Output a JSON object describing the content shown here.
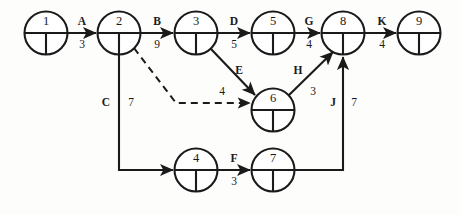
{
  "diagram": {
    "type": "activity-on-arrow-network",
    "title": "",
    "nodes": [
      {
        "id": "1",
        "label": "1",
        "cx": 46,
        "cy": 33
      },
      {
        "id": "2",
        "label": "2",
        "cx": 119,
        "cy": 33
      },
      {
        "id": "3",
        "label": "3",
        "cx": 196,
        "cy": 33
      },
      {
        "id": "5",
        "label": "5",
        "cx": 273,
        "cy": 33
      },
      {
        "id": "8",
        "label": "8",
        "cx": 343,
        "cy": 33
      },
      {
        "id": "9",
        "label": "9",
        "cx": 419,
        "cy": 33
      },
      {
        "id": "6",
        "label": "6",
        "cx": 273,
        "cy": 110
      },
      {
        "id": "4",
        "label": "4",
        "cx": 196,
        "cy": 170
      },
      {
        "id": "7",
        "label": "7",
        "cx": 273,
        "cy": 170
      }
    ],
    "node_radius": 21.5,
    "edges": [
      {
        "id": "A",
        "activity": "A",
        "duration": "3",
        "from": "1",
        "to": "2",
        "style": "solid",
        "label_x": 82,
        "label_act_y": 22,
        "label_dur_y": 45
      },
      {
        "id": "B",
        "activity": "B",
        "duration": "9",
        "from": "2",
        "to": "3",
        "style": "solid",
        "label_x": 157,
        "label_act_y": 22,
        "label_dur_y": 45
      },
      {
        "id": "D",
        "activity": "D",
        "duration": "5",
        "from": "3",
        "to": "5",
        "style": "solid",
        "label_x": 234,
        "label_act_y": 22,
        "label_dur_y": 45
      },
      {
        "id": "G",
        "activity": "G",
        "duration": "4",
        "from": "5",
        "to": "8",
        "style": "solid",
        "label_x": 309,
        "label_act_y": 22,
        "label_dur_y": 45
      },
      {
        "id": "K",
        "activity": "K",
        "duration": "4",
        "from": "8",
        "to": "9",
        "style": "solid",
        "label_x": 382,
        "label_act_y": 22,
        "label_dur_y": 45
      },
      {
        "id": "E",
        "activity": "E",
        "duration": "4",
        "from": "3",
        "to": "6",
        "style": "solid",
        "label_x": 239,
        "label_act_y": 71,
        "label_dur_y": 92
      },
      {
        "id": "H",
        "activity": "H",
        "duration": "3",
        "from": "6",
        "to": "8",
        "style": "solid",
        "label_x": 298,
        "label_act_y": 71,
        "label_dur_y": 92
      },
      {
        "id": "C",
        "activity": "C",
        "duration": "7",
        "from": "2",
        "to": "4",
        "style": "solid",
        "label_x": 106,
        "label_act_y": 103,
        "label_dur_y": 103
      },
      {
        "id": "F",
        "activity": "F",
        "duration": "3",
        "from": "4",
        "to": "7",
        "style": "solid",
        "label_x": 234,
        "label_act_y": 159,
        "label_dur_y": 182
      },
      {
        "id": "J",
        "activity": "J",
        "duration": "7",
        "from": "7",
        "to": "8",
        "style": "solid",
        "label_x": 334,
        "label_act_y": 103,
        "label_dur_y": 103
      },
      {
        "id": "dummy",
        "activity": "",
        "duration": "",
        "from": "2",
        "to": "6",
        "style": "dashed",
        "label_x": 0,
        "label_act_y": 0,
        "label_dur_y": 0
      }
    ],
    "labels": {
      "C_activity": "C",
      "C_duration": "7",
      "J_activity": "J",
      "J_duration": "7"
    },
    "colors": {
      "stroke": "#1a1a1a",
      "background": "#fdfdfc",
      "node_fill": "#ffffff"
    }
  }
}
